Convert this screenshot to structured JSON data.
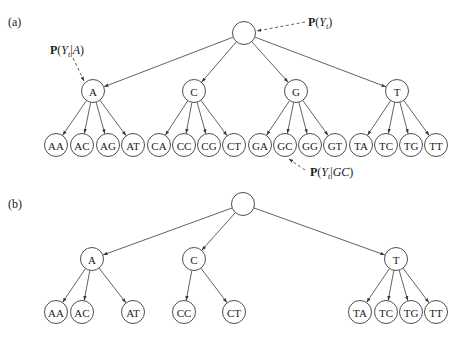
{
  "panels": [
    {
      "label": "(a)",
      "root": "",
      "children": [
        {
          "label": "A",
          "leaves": [
            "AA",
            "AC",
            "AG",
            "AT"
          ]
        },
        {
          "label": "C",
          "leaves": [
            "CA",
            "CC",
            "CG",
            "CT"
          ]
        },
        {
          "label": "G",
          "leaves": [
            "GA",
            "GC",
            "GG",
            "GT"
          ]
        },
        {
          "label": "T",
          "leaves": [
            "TA",
            "TC",
            "TG",
            "TT"
          ]
        }
      ],
      "annotations": [
        {
          "target": "root",
          "bold": "P",
          "open": "(",
          "var": "Y",
          "sub": "t",
          "cond": "",
          "close": ")"
        },
        {
          "target": "A",
          "bold": "P",
          "open": "(",
          "var": "Y",
          "sub": "t",
          "cond": "A",
          "close": ")"
        },
        {
          "target": "GC",
          "bold": "P",
          "open": "(",
          "var": "Y",
          "sub": "t",
          "cond": "GC",
          "close": ")"
        }
      ]
    },
    {
      "label": "(b)",
      "root": "",
      "children": [
        {
          "label": "A",
          "leaves": [
            "AA",
            "AC",
            "AT"
          ]
        },
        {
          "label": "C",
          "leaves": [
            "CC",
            "CT"
          ]
        },
        {
          "label": "T",
          "leaves": [
            "TA",
            "TC",
            "TG",
            "TT"
          ]
        }
      ],
      "annotations": []
    }
  ]
}
